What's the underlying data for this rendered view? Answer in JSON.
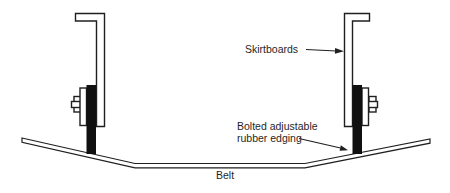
{
  "colors": {
    "line": "#1f1f1f",
    "rubber": "#101010",
    "paper": "#ffffff"
  },
  "diagram": {
    "labels": {
      "skirtboards": "Skirtboards",
      "rubber_edging_line1": "Bolted adjustable",
      "rubber_edging_line2": "rubber edging",
      "belt": "Belt"
    }
  }
}
